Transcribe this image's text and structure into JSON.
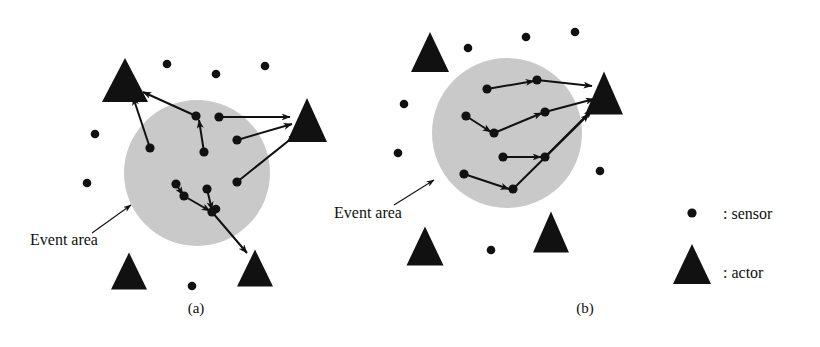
{
  "figure": {
    "background": "#ffffff",
    "width": 820,
    "height": 347,
    "ink_color": "#111111",
    "event_area_fill": "#c9c9c9"
  },
  "panels": [
    {
      "id": "a",
      "caption": "(a)",
      "caption_pos": {
        "x": 196,
        "y": 313
      },
      "event_area": {
        "label": "Event area",
        "label_pos": {
          "x": 30,
          "y": 245
        },
        "pointer": {
          "x1": 92,
          "y1": 233,
          "x2": 131,
          "y2": 205
        },
        "circle": {
          "cx": 197,
          "cy": 173,
          "r": 73
        }
      },
      "actors": [
        {
          "name": "actor-top-left",
          "cx": 125,
          "cy": 80,
          "w": 46,
          "h": 44
        },
        {
          "name": "actor-right",
          "cx": 307,
          "cy": 120,
          "w": 40,
          "h": 44
        },
        {
          "name": "actor-bottom-left",
          "cx": 129,
          "cy": 271,
          "w": 36,
          "h": 37
        },
        {
          "name": "actor-bottom-right",
          "cx": 255,
          "cy": 268,
          "w": 36,
          "h": 37
        }
      ],
      "sensors_outside": [
        {
          "x": 167,
          "y": 64
        },
        {
          "x": 216,
          "y": 74
        },
        {
          "x": 265,
          "y": 66
        },
        {
          "x": 95,
          "y": 134
        },
        {
          "x": 87,
          "y": 183
        },
        {
          "x": 216,
          "y": 209
        },
        {
          "x": 192,
          "y": 286
        }
      ],
      "sensors_inside": [
        {
          "id": "s1",
          "x": 196,
          "y": 116
        },
        {
          "id": "s2",
          "x": 204,
          "y": 152
        },
        {
          "id": "s3",
          "x": 150,
          "y": 148
        },
        {
          "id": "s4",
          "x": 219,
          "y": 117
        },
        {
          "id": "s5",
          "x": 237,
          "y": 140
        },
        {
          "id": "s6",
          "x": 237,
          "y": 182
        },
        {
          "id": "s7",
          "x": 176,
          "y": 184
        },
        {
          "id": "s8",
          "x": 184,
          "y": 196
        },
        {
          "id": "s9",
          "x": 207,
          "y": 189
        },
        {
          "id": "s10",
          "x": 212,
          "y": 212
        }
      ],
      "links": [
        {
          "from": {
            "x": 196,
            "y": 116
          },
          "to": {
            "x": 143,
            "y": 92
          }
        },
        {
          "from": {
            "x": 204,
            "y": 152
          },
          "to": {
            "x": 199,
            "y": 120
          }
        },
        {
          "from": {
            "x": 150,
            "y": 148
          },
          "to": {
            "x": 133,
            "y": 97
          }
        },
        {
          "from": {
            "x": 219,
            "y": 117
          },
          "to": {
            "x": 290,
            "y": 117
          }
        },
        {
          "from": {
            "x": 237,
            "y": 140
          },
          "to": {
            "x": 292,
            "y": 124
          }
        },
        {
          "from": {
            "x": 237,
            "y": 182
          },
          "to": {
            "x": 297,
            "y": 134
          }
        },
        {
          "from": {
            "x": 176,
            "y": 184
          },
          "to": {
            "x": 183,
            "y": 195
          }
        },
        {
          "from": {
            "x": 184,
            "y": 196
          },
          "to": {
            "x": 210,
            "y": 211
          }
        },
        {
          "from": {
            "x": 207,
            "y": 189
          },
          "to": {
            "x": 212,
            "y": 210
          }
        },
        {
          "from": {
            "x": 212,
            "y": 212
          },
          "to": {
            "x": 247,
            "y": 253
          }
        }
      ]
    },
    {
      "id": "b",
      "caption": "(b)",
      "caption_pos": {
        "x": 585,
        "y": 313
      },
      "event_area": {
        "label": "Event area",
        "label_pos": {
          "x": 334,
          "y": 218
        },
        "pointer": {
          "x1": 394,
          "y1": 205,
          "x2": 434,
          "y2": 180
        },
        "circle": {
          "cx": 507,
          "cy": 133,
          "r": 75
        }
      },
      "actors": [
        {
          "name": "actor-top-left",
          "cx": 430,
          "cy": 52,
          "w": 38,
          "h": 40
        },
        {
          "name": "actor-right",
          "cx": 604,
          "cy": 93,
          "w": 38,
          "h": 43
        },
        {
          "name": "actor-bottom-left",
          "cx": 425,
          "cy": 246,
          "w": 37,
          "h": 39
        },
        {
          "name": "actor-bottom-right",
          "cx": 551,
          "cy": 232,
          "w": 36,
          "h": 41
        }
      ],
      "sensors_outside": [
        {
          "x": 468,
          "y": 48
        },
        {
          "x": 526,
          "y": 37
        },
        {
          "x": 575,
          "y": 32
        },
        {
          "x": 404,
          "y": 104
        },
        {
          "x": 398,
          "y": 153
        },
        {
          "x": 600,
          "y": 171
        },
        {
          "x": 491,
          "y": 250
        }
      ],
      "sensors_inside": [
        {
          "id": "s1",
          "x": 487,
          "y": 89
        },
        {
          "id": "s2",
          "x": 537,
          "y": 80
        },
        {
          "id": "s3",
          "x": 494,
          "y": 133
        },
        {
          "id": "s4",
          "x": 466,
          "y": 116
        },
        {
          "id": "s5",
          "x": 545,
          "y": 112
        },
        {
          "id": "s6",
          "x": 545,
          "y": 157
        },
        {
          "id": "s7",
          "x": 503,
          "y": 157
        },
        {
          "id": "s8",
          "x": 513,
          "y": 189
        },
        {
          "id": "s9",
          "x": 464,
          "y": 174
        }
      ],
      "links": [
        {
          "from": {
            "x": 487,
            "y": 89
          },
          "to": {
            "x": 534,
            "y": 81
          }
        },
        {
          "from": {
            "x": 537,
            "y": 80
          },
          "to": {
            "x": 592,
            "y": 86
          }
        },
        {
          "from": {
            "x": 466,
            "y": 116
          },
          "to": {
            "x": 491,
            "y": 132
          }
        },
        {
          "from": {
            "x": 494,
            "y": 133
          },
          "to": {
            "x": 542,
            "y": 113
          }
        },
        {
          "from": {
            "x": 545,
            "y": 112
          },
          "to": {
            "x": 594,
            "y": 99
          }
        },
        {
          "from": {
            "x": 503,
            "y": 157
          },
          "to": {
            "x": 541,
            "y": 157
          }
        },
        {
          "from": {
            "x": 545,
            "y": 157
          },
          "to": {
            "x": 592,
            "y": 110
          }
        },
        {
          "from": {
            "x": 464,
            "y": 174
          },
          "to": {
            "x": 509,
            "y": 189
          }
        },
        {
          "from": {
            "x": 513,
            "y": 189
          },
          "to": {
            "x": 589,
            "y": 114
          }
        }
      ]
    }
  ],
  "legend": {
    "items": [
      {
        "symbol": "sensor-dot",
        "label": ": sensor",
        "symbol_pos": {
          "x": 692,
          "y": 213
        },
        "label_pos": {
          "x": 723,
          "y": 219
        }
      },
      {
        "symbol": "actor-triangle",
        "label": ": actor",
        "symbol_pos": {
          "x": 692,
          "y": 265
        },
        "label_pos": {
          "x": 723,
          "y": 278
        }
      }
    ]
  }
}
